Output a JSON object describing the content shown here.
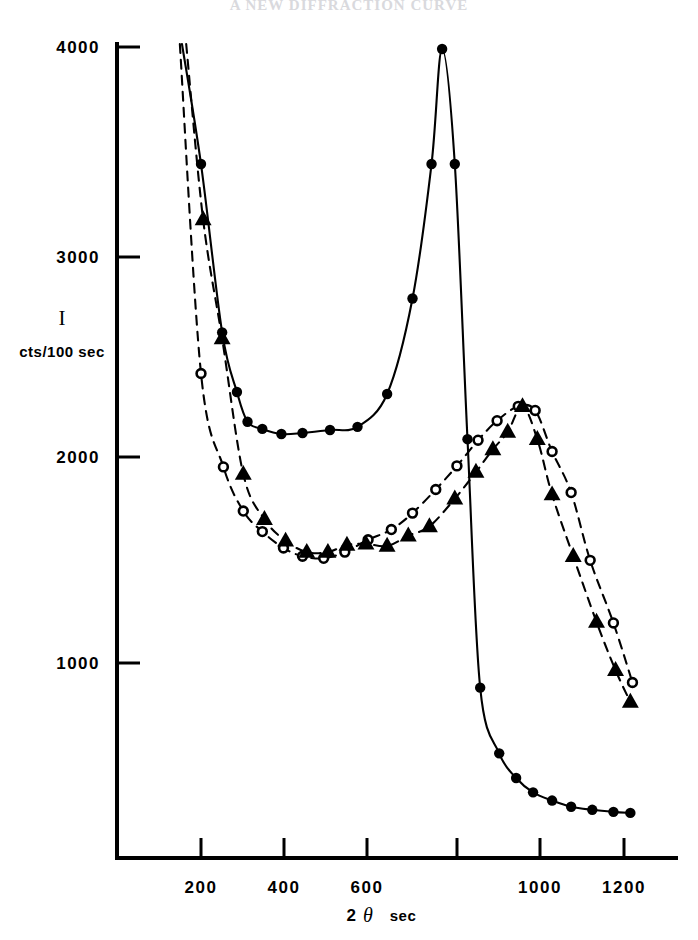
{
  "header": {
    "cut_off_title": "A NEW DIFFRACTION CURVE"
  },
  "axis": {
    "y_symbol": "I",
    "y_unit": "cts/100 sec",
    "x_number": "2",
    "x_symbol": "θ",
    "x_unit": "sec",
    "y_ticks": [
      "1000",
      "2000",
      "3000",
      "4000"
    ],
    "x_ticks": [
      "200",
      "400",
      "600",
      "800",
      "1000",
      "1200"
    ]
  },
  "chart_data": {
    "type": "line",
    "title": "",
    "xlabel": "2θ sec",
    "ylabel": "I cts/100 sec",
    "xlim": [
      100,
      1270
    ],
    "ylim": [
      0,
      4150
    ],
    "grid": false,
    "legend": "none",
    "x_ticks": [
      200,
      400,
      600,
      800,
      1000,
      1200
    ],
    "y_ticks": [
      1000,
      2000,
      3000,
      4000
    ],
    "series": [
      {
        "name": "filled-circle-curve",
        "marker": "filled-circle",
        "line": "solid",
        "points": [
          {
            "x": 155,
            "y": 4150
          },
          {
            "x": 200,
            "y": 3430
          },
          {
            "x": 250,
            "y": 2610
          },
          {
            "x": 285,
            "y": 2320
          },
          {
            "x": 310,
            "y": 2175
          },
          {
            "x": 345,
            "y": 2140
          },
          {
            "x": 390,
            "y": 2115
          },
          {
            "x": 440,
            "y": 2120
          },
          {
            "x": 505,
            "y": 2135
          },
          {
            "x": 570,
            "y": 2150
          },
          {
            "x": 640,
            "y": 2310
          },
          {
            "x": 700,
            "y": 2775
          },
          {
            "x": 745,
            "y": 3430
          },
          {
            "x": 770,
            "y": 3990
          },
          {
            "x": 800,
            "y": 3430
          },
          {
            "x": 830,
            "y": 2090
          },
          {
            "x": 860,
            "y": 880
          },
          {
            "x": 905,
            "y": 560
          },
          {
            "x": 945,
            "y": 440
          },
          {
            "x": 985,
            "y": 370
          },
          {
            "x": 1030,
            "y": 330
          },
          {
            "x": 1075,
            "y": 300
          },
          {
            "x": 1125,
            "y": 285
          },
          {
            "x": 1175,
            "y": 275
          },
          {
            "x": 1215,
            "y": 270
          }
        ]
      },
      {
        "name": "open-circle-curve",
        "marker": "open-circle",
        "line": "dashed",
        "points": [
          {
            "x": 150,
            "y": 4150
          },
          {
            "x": 200,
            "y": 2410
          },
          {
            "x": 253,
            "y": 1955
          },
          {
            "x": 300,
            "y": 1740
          },
          {
            "x": 345,
            "y": 1640
          },
          {
            "x": 395,
            "y": 1560
          },
          {
            "x": 440,
            "y": 1520
          },
          {
            "x": 490,
            "y": 1510
          },
          {
            "x": 540,
            "y": 1540
          },
          {
            "x": 595,
            "y": 1600
          },
          {
            "x": 650,
            "y": 1650
          },
          {
            "x": 700,
            "y": 1730
          },
          {
            "x": 755,
            "y": 1845
          },
          {
            "x": 805,
            "y": 1960
          },
          {
            "x": 855,
            "y": 2085
          },
          {
            "x": 900,
            "y": 2180
          },
          {
            "x": 950,
            "y": 2250
          },
          {
            "x": 990,
            "y": 2230
          },
          {
            "x": 1030,
            "y": 2030
          },
          {
            "x": 1075,
            "y": 1830
          },
          {
            "x": 1120,
            "y": 1500
          },
          {
            "x": 1175,
            "y": 1195
          },
          {
            "x": 1220,
            "y": 905
          }
        ]
      },
      {
        "name": "filled-triangle-curve",
        "marker": "filled-triangle",
        "line": "dashed",
        "points": [
          {
            "x": 165,
            "y": 4150
          },
          {
            "x": 205,
            "y": 3160
          },
          {
            "x": 250,
            "y": 2580
          },
          {
            "x": 300,
            "y": 1920
          },
          {
            "x": 350,
            "y": 1700
          },
          {
            "x": 400,
            "y": 1595
          },
          {
            "x": 450,
            "y": 1540
          },
          {
            "x": 500,
            "y": 1540
          },
          {
            "x": 545,
            "y": 1575
          },
          {
            "x": 590,
            "y": 1580
          },
          {
            "x": 640,
            "y": 1570
          },
          {
            "x": 690,
            "y": 1620
          },
          {
            "x": 740,
            "y": 1665
          },
          {
            "x": 800,
            "y": 1800
          },
          {
            "x": 850,
            "y": 1930
          },
          {
            "x": 890,
            "y": 2040
          },
          {
            "x": 925,
            "y": 2125
          },
          {
            "x": 960,
            "y": 2250
          },
          {
            "x": 995,
            "y": 2090
          },
          {
            "x": 1030,
            "y": 1820
          },
          {
            "x": 1080,
            "y": 1520
          },
          {
            "x": 1135,
            "y": 1200
          },
          {
            "x": 1180,
            "y": 965
          },
          {
            "x": 1215,
            "y": 810
          }
        ]
      }
    ]
  }
}
